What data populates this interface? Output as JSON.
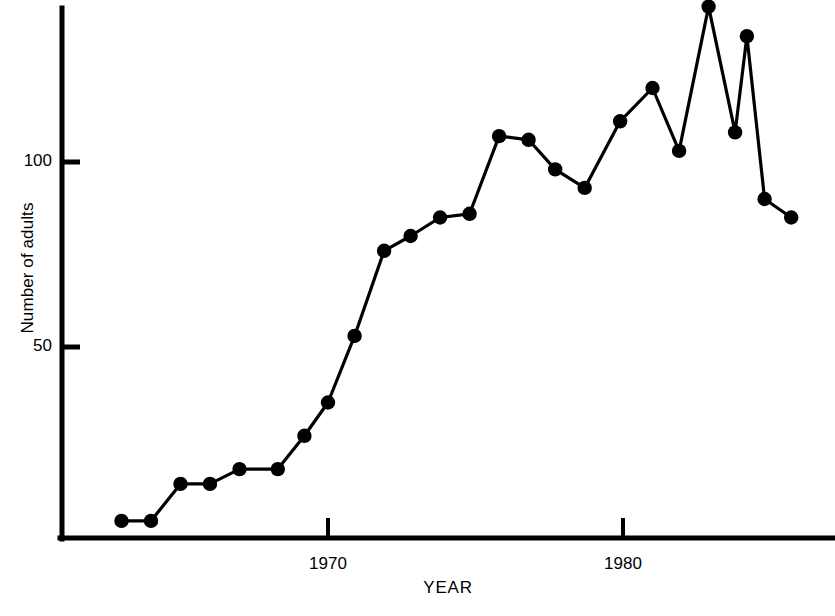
{
  "chart_data": {
    "type": "line",
    "title": "",
    "xlabel": "YEAR",
    "ylabel": "Number of adults",
    "grid": false,
    "legend": "none",
    "marker": "filled-circle",
    "xlim": [
      1962.2,
      1987.2
    ],
    "ylim": [
      0,
      145
    ],
    "xticks": [
      1970,
      1980
    ],
    "xtick_labels": [
      "1970",
      "1980"
    ],
    "yticks": [
      50,
      100
    ],
    "ytick_labels": [
      "50",
      "100"
    ],
    "x": [
      1963,
      1964,
      1965,
      1966,
      1967,
      1968.3,
      1969.2,
      1970,
      1970.9,
      1971.9,
      1972.8,
      1973.8,
      1974.8,
      1975.8,
      1976.8,
      1977.7,
      1978.7,
      1979.9,
      1981.0,
      1981.9,
      1982.9,
      1983.8,
      1984.2,
      1984.8,
      1985.7
    ],
    "values": [
      3,
      3,
      13,
      13,
      17,
      17,
      26,
      35,
      53,
      76,
      80,
      85,
      86,
      107,
      106,
      98,
      93,
      111,
      120,
      103,
      142,
      108,
      134,
      90,
      85
    ],
    "points_px": [
      [
        116,
        520
      ],
      [
        147,
        520
      ],
      [
        175,
        483
      ],
      [
        205,
        484
      ],
      [
        233,
        471
      ],
      [
        273,
        469
      ],
      [
        300,
        437
      ],
      [
        328,
        402
      ],
      [
        355,
        336
      ],
      [
        383,
        252
      ],
      [
        411,
        235
      ],
      [
        441,
        219
      ],
      [
        471,
        217
      ],
      [
        499,
        136
      ],
      [
        528,
        138
      ],
      [
        555,
        168
      ],
      [
        584,
        186
      ],
      [
        620,
        121
      ],
      [
        651,
        87
      ],
      [
        679,
        150
      ],
      [
        707,
        6
      ],
      [
        734,
        134
      ],
      [
        746,
        35
      ],
      [
        763,
        200
      ],
      [
        792,
        216
      ]
    ],
    "colors": {
      "line": "#000000",
      "marker": "#000000",
      "axis": "#000000",
      "background": "#ffffff"
    }
  },
  "axes": {
    "y_axis_label": "Number of adults",
    "x_axis_label": "YEAR",
    "y_tick_100": "100",
    "y_tick_50": "50",
    "x_tick_1970": "1970",
    "x_tick_1980": "1980"
  }
}
